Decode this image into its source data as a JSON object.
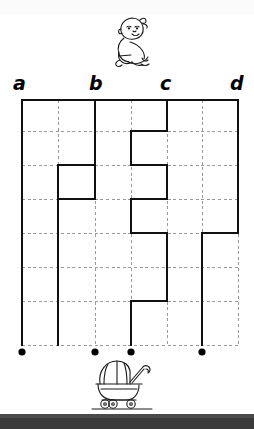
{
  "page": {
    "width": 254,
    "height": 429,
    "background_color": "#ffffff",
    "bottom_band_color": "#3b3b3b"
  },
  "illustrations": [
    {
      "name": "baby-illustration",
      "label": "sitting baby",
      "x": 108,
      "y": 12,
      "width": 62,
      "height": 62
    },
    {
      "name": "stroller-illustration",
      "label": "baby stroller / pram",
      "x": 86,
      "y": 356,
      "width": 70,
      "height": 56
    }
  ],
  "labels": {
    "column_letters": [
      {
        "text": "a",
        "x": 13,
        "y": 74
      },
      {
        "text": "b",
        "x": 89,
        "y": 74
      },
      {
        "text": "c",
        "x": 160,
        "y": 74
      },
      {
        "text": "d",
        "x": 230,
        "y": 74
      }
    ]
  },
  "chart_data": {
    "type": "table",
    "grid": {
      "x_gridlines": [
        22,
        58,
        95,
        131,
        167,
        202,
        238
      ],
      "y_gridlines": [
        100,
        131,
        165,
        199,
        233,
        267,
        301,
        345
      ],
      "x_min": 22,
      "x_max": 238,
      "y_min": 100,
      "y_max": 345,
      "dash_color": "#9a9a9a",
      "path_color": "#111111",
      "grid_on": true
    },
    "path_segments": [
      {
        "id": "top-border",
        "x1": 22,
        "y1": 100,
        "x2": 238,
        "y2": 100
      },
      {
        "id": "a-vertical-full",
        "x1": 22,
        "y1": 100,
        "x2": 22,
        "y2": 345
      },
      {
        "id": "b-vertical-top",
        "x1": 95,
        "y1": 100,
        "x2": 95,
        "y2": 199
      },
      {
        "id": "b-cross-upper",
        "x1": 58,
        "y1": 165,
        "x2": 95,
        "y2": 165
      },
      {
        "id": "b-left-mid",
        "x1": 58,
        "y1": 165,
        "x2": 58,
        "y2": 199
      },
      {
        "id": "b-cross-lower",
        "x1": 58,
        "y1": 199,
        "x2": 95,
        "y2": 199
      },
      {
        "id": "b-vertical-bottom",
        "x1": 58,
        "y1": 199,
        "x2": 58,
        "y2": 345
      },
      {
        "id": "c-vertical-top",
        "x1": 167,
        "y1": 100,
        "x2": 167,
        "y2": 131
      },
      {
        "id": "c-cross-1",
        "x1": 131,
        "y1": 131,
        "x2": 167,
        "y2": 131
      },
      {
        "id": "c-left-1",
        "x1": 131,
        "y1": 131,
        "x2": 131,
        "y2": 165
      },
      {
        "id": "c-cross-2",
        "x1": 131,
        "y1": 165,
        "x2": 167,
        "y2": 165
      },
      {
        "id": "c-right-1",
        "x1": 167,
        "y1": 165,
        "x2": 167,
        "y2": 199
      },
      {
        "id": "c-cross-3",
        "x1": 131,
        "y1": 199,
        "x2": 167,
        "y2": 199
      },
      {
        "id": "c-left-2",
        "x1": 131,
        "y1": 199,
        "x2": 131,
        "y2": 233
      },
      {
        "id": "c-cross-4",
        "x1": 131,
        "y1": 233,
        "x2": 167,
        "y2": 233
      },
      {
        "id": "c-right-2",
        "x1": 167,
        "y1": 233,
        "x2": 167,
        "y2": 301
      },
      {
        "id": "c-cross-5",
        "x1": 131,
        "y1": 301,
        "x2": 167,
        "y2": 301
      },
      {
        "id": "c-vertical-bottom",
        "x1": 131,
        "y1": 301,
        "x2": 131,
        "y2": 345
      },
      {
        "id": "d-cross-upper",
        "x1": 202,
        "y1": 233,
        "x2": 238,
        "y2": 233
      },
      {
        "id": "d-right-top",
        "x1": 238,
        "y1": 100,
        "x2": 238,
        "y2": 233
      },
      {
        "id": "d-vertical-bottom",
        "x1": 202,
        "y1": 233,
        "x2": 202,
        "y2": 345
      }
    ],
    "end_dots": [
      {
        "label": "dot-1",
        "x": 22,
        "y": 352
      },
      {
        "label": "dot-2",
        "x": 95,
        "y": 352
      },
      {
        "label": "dot-3",
        "x": 131,
        "y": 352
      },
      {
        "label": "dot-4",
        "x": 202,
        "y": 352
      }
    ]
  }
}
